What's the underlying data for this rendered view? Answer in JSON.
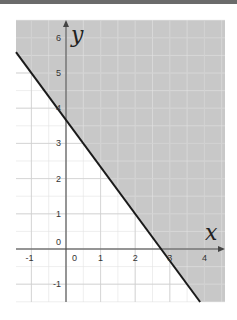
{
  "chart_data": {
    "type": "line",
    "title": "",
    "xlabel": "x",
    "ylabel": "y",
    "xlim": [
      -1.45,
      4.6
    ],
    "ylim": [
      -1.55,
      6.5
    ],
    "grid": true,
    "x_ticks": [
      "-1",
      "0",
      "1",
      "2",
      "3",
      "4"
    ],
    "y_ticks": [
      "-1",
      "0",
      "1",
      "2",
      "3",
      "4",
      "5",
      "6"
    ],
    "series": [
      {
        "name": "boundary line y = -4/3 x + 11/3",
        "x": [
          -1.45,
          4.6
        ],
        "y": [
          5.6,
          -2.47
        ],
        "style": "solid",
        "color": "#1a1a1a"
      }
    ],
    "shaded_region": {
      "description": "half-plane above the line (4x + 3y >= 11) shaded gray",
      "color": "#c8c8c8"
    },
    "annotations": [
      "x",
      "y"
    ]
  },
  "labels": {
    "x_axis": "x",
    "y_axis": "y",
    "origin": "0"
  }
}
